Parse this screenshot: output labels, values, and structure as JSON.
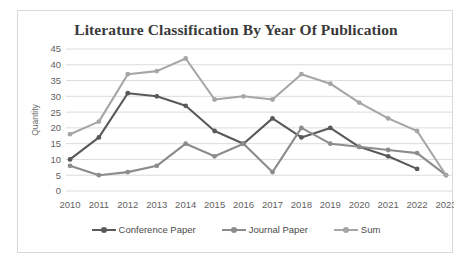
{
  "chart_data": {
    "type": "line",
    "title": "Literature Classification By Year Of Publication",
    "xlabel": "",
    "ylabel": "Quantity",
    "categories": [
      "2010",
      "2011",
      "2012",
      "2013",
      "2014",
      "2015",
      "2016",
      "2017",
      "2018",
      "2019",
      "2020",
      "2021",
      "2022",
      "2023"
    ],
    "x": [
      2010,
      2011,
      2012,
      2013,
      2014,
      2015,
      2016,
      2017,
      2018,
      2019,
      2020,
      2021,
      2022,
      2023
    ],
    "ylim": [
      0,
      45
    ],
    "yticks": [
      0,
      5,
      10,
      15,
      20,
      25,
      30,
      35,
      40,
      45
    ],
    "grid": true,
    "legend_position": "bottom",
    "series": [
      {
        "name": "Conference Paper",
        "color": "#595959",
        "values": [
          10,
          17,
          31,
          30,
          27,
          19,
          15,
          23,
          17,
          20,
          14,
          11,
          7,
          null
        ]
      },
      {
        "name": "Journal Paper",
        "color": "#8c8c8c",
        "values": [
          8,
          5,
          6,
          8,
          15,
          11,
          15,
          6,
          20,
          15,
          14,
          13,
          12,
          5
        ]
      },
      {
        "name": "Sum",
        "color": "#a6a6a6",
        "values": [
          18,
          22,
          37,
          38,
          42,
          29,
          30,
          29,
          37,
          34,
          28,
          23,
          19,
          5
        ]
      }
    ]
  },
  "legend": {
    "items": [
      {
        "label": "Conference Paper"
      },
      {
        "label": "Journal Paper"
      },
      {
        "label": "Sum"
      }
    ]
  },
  "colors": {
    "conference_paper": "#595959",
    "journal_paper": "#8c8c8c",
    "sum": "#a6a6a6",
    "gridline": "#dcdcdc",
    "border": "#d8d8d8",
    "title_text": "#3a3a3a",
    "tick_text": "#5f5f5f"
  }
}
